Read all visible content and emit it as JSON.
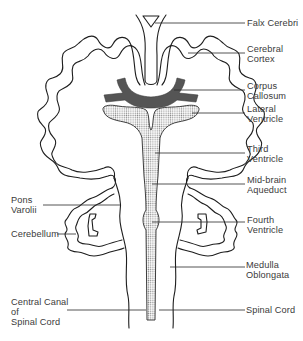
{
  "diagram": {
    "colors": {
      "background": "#ffffff",
      "line": "#1e1e1e",
      "corpus_callosum_fill": "#555555",
      "ventricle_stipple": "#9a9a9a",
      "label_text": "#3a3a3a"
    },
    "labels_right": [
      {
        "id": "falx-cerebri",
        "text": "Falx Cerebri"
      },
      {
        "id": "cerebral-cortex",
        "text": "Cerebral\nCortex"
      },
      {
        "id": "corpus-callosum",
        "text": "Corpus\nCallosum"
      },
      {
        "id": "lateral-ventricle",
        "text": "Lateral\nVentricle"
      },
      {
        "id": "third-ventricle",
        "text": "Third\nVentricle"
      },
      {
        "id": "mid-brain-aqueduct",
        "text": "Mid-brain\nAqueduct"
      },
      {
        "id": "fourth-ventricle",
        "text": "Fourth\nVentricle"
      },
      {
        "id": "medulla-oblongata",
        "text": "Medulla\nOblongata"
      },
      {
        "id": "spinal-cord",
        "text": "Spinal Cord"
      }
    ],
    "labels_left": [
      {
        "id": "pons-varolii",
        "text": "Pons\nVarolii"
      },
      {
        "id": "cerebellum",
        "text": "Cerebellum"
      },
      {
        "id": "central-canal",
        "text": "Central Canal\nof\nSpinal Cord"
      }
    ]
  }
}
